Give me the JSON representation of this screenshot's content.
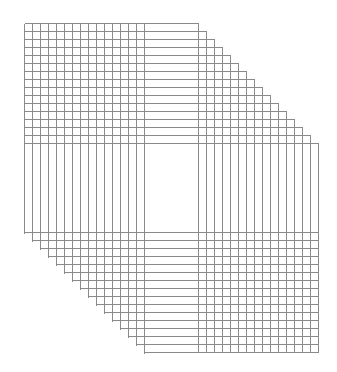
{
  "artwork": {
    "type": "line-grid-artwork",
    "background": "#ffffff",
    "line_color": "#8a8a8a",
    "line_width": 1,
    "count": 16,
    "spacing": 8,
    "left_verticals": {
      "x_start": 24,
      "y_top": 23,
      "y_bottom_start": 233
    },
    "top_horizontals": {
      "y_start": 23,
      "x_left": 24,
      "x_right_start": 198
    },
    "right_verticals": {
      "x_start": 198,
      "y_top_start": 23,
      "y_bottom": 352
    },
    "bottom_horizontals": {
      "y_start": 232,
      "x_left_start": 24,
      "x_right": 318
    }
  }
}
